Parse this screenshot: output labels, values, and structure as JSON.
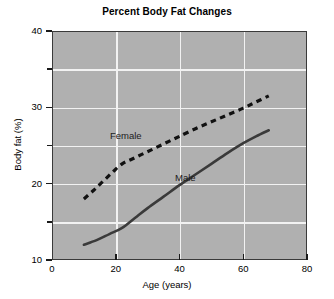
{
  "chart_data": {
    "type": "line",
    "title": "Percent Body Fat Changes",
    "xlabel": "Age (years)",
    "ylabel": "Body fat (%)",
    "xlim": [
      0,
      80
    ],
    "ylim": [
      10,
      40
    ],
    "xticks": [
      0,
      20,
      40,
      60,
      80
    ],
    "yticks": [
      10,
      20,
      30,
      40
    ],
    "y_minor_ticks": [
      15,
      25,
      35
    ],
    "grid": true,
    "grid_color": "#f2f2f2",
    "plot_background": "#b0b0b0",
    "legend_position": "inline-annotation",
    "series": [
      {
        "name": "Female",
        "style": "dashed",
        "color": "#111111",
        "label_position": {
          "x": 26,
          "y": 26.2
        },
        "x": [
          10,
          13,
          16,
          19,
          22,
          25,
          28,
          31,
          34,
          37,
          40,
          45,
          50,
          55,
          60,
          64,
          68
        ],
        "y": [
          18.0,
          19.1,
          20.3,
          21.5,
          22.6,
          23.2,
          23.8,
          24.4,
          25.0,
          25.6,
          26.2,
          27.2,
          28.1,
          29.0,
          29.9,
          30.7,
          31.5
        ]
      },
      {
        "name": "Male",
        "style": "solid",
        "color": "#3a3a3a",
        "label_position": {
          "x": 43,
          "y": 20.8
        },
        "x": [
          10,
          14,
          18,
          22,
          26,
          30,
          35,
          40,
          45,
          50,
          55,
          60,
          64,
          68
        ],
        "y": [
          12.0,
          12.6,
          13.4,
          14.2,
          15.5,
          16.8,
          18.3,
          19.8,
          21.2,
          22.6,
          24.0,
          25.3,
          26.2,
          27.0
        ]
      }
    ]
  },
  "chart": {
    "title": "Percent Body Fat Changes",
    "x_axis_title": "Age (years)",
    "y_axis_title": "Body fat (%)",
    "x_tick_labels": [
      "0",
      "20",
      "40",
      "60",
      "80"
    ],
    "y_tick_labels": [
      "10",
      "20",
      "30",
      "40"
    ],
    "annotations": {
      "female_label": "Female",
      "male_label": "Male"
    }
  }
}
